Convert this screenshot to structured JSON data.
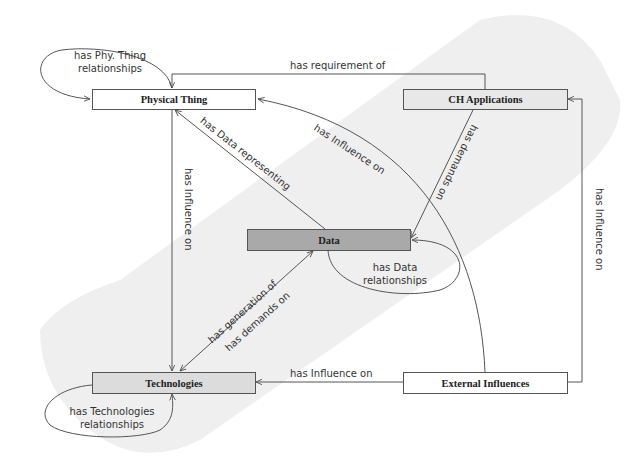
{
  "diagram": {
    "type": "concept-map",
    "nodes": [
      {
        "id": "physical_thing",
        "label": "Physical Thing",
        "fill": "#ffffff"
      },
      {
        "id": "ch_applications",
        "label": "CH Applications",
        "fill": "#e6e6e6"
      },
      {
        "id": "data",
        "label": "Data",
        "fill": "#a9a9a9"
      },
      {
        "id": "technologies",
        "label": "Technologies",
        "fill": "#dcdcdc"
      },
      {
        "id": "external_influences",
        "label": "External Influences",
        "fill": "#ffffff"
      }
    ],
    "edges": [
      {
        "from": "physical_thing",
        "to": "physical_thing",
        "label": "has Phy. Thing relationships"
      },
      {
        "from": "ch_applications",
        "to": "physical_thing",
        "label": "has requirement of"
      },
      {
        "from": "data",
        "to": "physical_thing",
        "label": "has Data representing"
      },
      {
        "from": "external_influences",
        "to": "physical_thing",
        "label": "has Influence on"
      },
      {
        "from": "ch_applications",
        "to": "data",
        "label": "has demands on"
      },
      {
        "from": "physical_thing",
        "to": "technologies",
        "label": "has Influence on"
      },
      {
        "from": "data",
        "to": "data",
        "label": "has Data relationships"
      },
      {
        "from": "technologies",
        "to": "data",
        "label": "has generation of / has demands on"
      },
      {
        "from": "external_influences",
        "to": "technologies",
        "label": "has Influence on"
      },
      {
        "from": "external_influences",
        "to": "ch_applications",
        "label": "has Influence on"
      },
      {
        "from": "technologies",
        "to": "technologies",
        "label": "has Technologies relationships"
      }
    ]
  },
  "labels": {
    "phy_self_1": "has Phy. Thing",
    "phy_self_2": "relationships",
    "requirement": "has requirement  of",
    "data_representing": "has Data representing",
    "influence_curve": "has Influence  on",
    "demands": "has demands on",
    "influence_vertical_left": "has Influence  on",
    "data_self_1": "has Data",
    "data_self_2": "relationships",
    "generation": "has generation of",
    "demands_on": "has demands on",
    "influence_bottom": "has Influence  on",
    "influence_vertical_right": "has Influence  on",
    "tech_self_1": "has Technologies",
    "tech_self_2": "relationships"
  },
  "colors": {
    "line": "#555555",
    "blob": "#ebebeb"
  }
}
